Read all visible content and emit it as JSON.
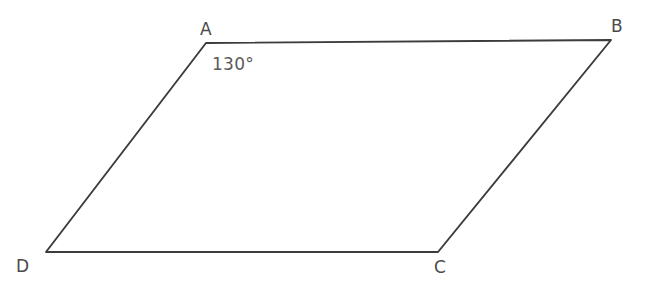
{
  "figure": {
    "kind": "parallelogram-diagram",
    "background_color": "#ffffff",
    "stroke_color": "#3c3c3c",
    "stroke_width": 1.9,
    "label_color": "#4a4a4a",
    "angle_label_color": "#5a5a5a",
    "vertices": [
      {
        "name": "A",
        "label": "A",
        "x": 206,
        "y": 43,
        "label_x": 200,
        "label_y": 21
      },
      {
        "name": "B",
        "label": "B",
        "x": 611,
        "y": 40,
        "label_x": 611,
        "label_y": 18
      },
      {
        "name": "C",
        "label": "C",
        "x": 438,
        "y": 252,
        "label_x": 434,
        "label_y": 259
      },
      {
        "name": "D",
        "label": "D",
        "x": 46,
        "y": 252,
        "label_x": 16,
        "label_y": 258
      }
    ],
    "edges": [
      {
        "name": "edge-AB",
        "from": "A",
        "to": "B"
      },
      {
        "name": "edge-BC",
        "from": "B",
        "to": "C"
      },
      {
        "name": "edge-CD",
        "from": "C",
        "to": "D"
      },
      {
        "name": "edge-DA",
        "from": "D",
        "to": "A"
      }
    ],
    "angles": [
      {
        "name": "angle-at-A",
        "vertex": "A",
        "value": 130,
        "unit": "degree",
        "text": "130°",
        "label_x": 212,
        "label_y": 56
      }
    ]
  }
}
